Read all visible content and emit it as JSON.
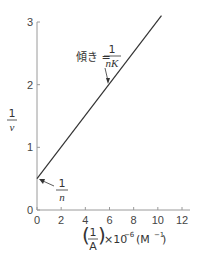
{
  "chart_data": {
    "type": "line",
    "title": "",
    "xlabel": "(1/A)×10⁻⁶ (M⁻¹)",
    "ylabel": "1/v",
    "xlim": [
      0,
      12
    ],
    "ylim": [
      0,
      3
    ],
    "x_ticks": [
      "0",
      "2",
      "4",
      "6",
      "8",
      "10",
      "12"
    ],
    "y_ticks": [
      "0",
      "1",
      "2",
      "3"
    ],
    "grid": false,
    "legend": null,
    "series": [
      {
        "name": "Lineweaver-Burk line",
        "x": [
          0,
          10.3
        ],
        "y": [
          0.5,
          3.1
        ]
      }
    ],
    "annotations": [
      {
        "text": "傾き = 1/nK",
        "meaning": "slope = 1/(nK)",
        "points_to": [
          6,
          2.0
        ]
      },
      {
        "text": "1/n",
        "meaning": "y-intercept",
        "points_to": [
          0,
          0.5
        ]
      }
    ]
  },
  "labels": {
    "y_num": "1",
    "y_den": "v",
    "x_paren_num": "1",
    "x_paren_den": "A",
    "x_suffix": "×10",
    "x_exp": "−6",
    "x_unit": "(M",
    "x_unit_exp": "−1",
    "x_unit_close": ")",
    "slope_prefix": "傾き =",
    "slope_num": "1",
    "slope_den": "nK",
    "intercept_num": "1",
    "intercept_den": "n"
  },
  "colors": {
    "line": "#333333",
    "axis": "#999999",
    "text": "#333333"
  }
}
